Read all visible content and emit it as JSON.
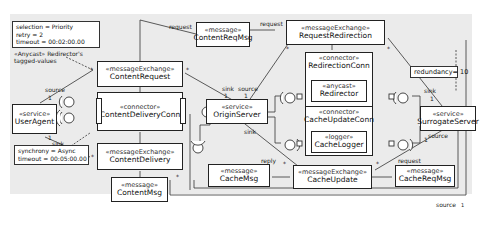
{
  "notes": {
    "redirector_values": [
      "selection = Priority",
      "retry = 2",
      "timeout = 00:02:00.00"
    ],
    "redirector_caption": [
      "«Anycast» Redirector's",
      "tagged-values"
    ],
    "delivery_values": [
      "synchrony = Async",
      "timeout = 00:05:00.00"
    ],
    "redundancy": "redundancy= 10"
  },
  "elements": {
    "user_agent": {
      "stereotype": "«service»",
      "name": "UserAgent"
    },
    "content_request": {
      "stereotype": "«messageExchange»",
      "name": "ContentRequest"
    },
    "content_delivery_conn": {
      "stereotype": "«connector»",
      "name": "ContentDeliveryConn"
    },
    "content_delivery": {
      "stereotype": "«messageExchange»",
      "name": "ContentDelivery"
    },
    "content_msg": {
      "stereotype": "«message»",
      "name": "ContentMsg"
    },
    "content_req_msg": {
      "stereotype": "«message»",
      "name": "ContentReqMsg"
    },
    "request_redirection": {
      "stereotype": "«messageExchange»",
      "name": "RequestRedirection"
    },
    "origin_server": {
      "stereotype": "«service»",
      "name": "OriginServer"
    },
    "redirection_conn": {
      "stereotype": "«connector»",
      "name": "RedirectionConn"
    },
    "redirector": {
      "stereotype": "«anycast»",
      "name": "Redirector"
    },
    "cache_update_conn": {
      "stereotype": "«connector»",
      "name": "CacheUpdateConn"
    },
    "cache_logger": {
      "stereotype": "«logger»",
      "name": "CacheLogger"
    },
    "surrogate_server": {
      "stereotype": "«service»",
      "name": "SurrogateServer"
    },
    "cache_msg": {
      "stereotype": "«message»",
      "name": "CacheMsg"
    },
    "cache_update": {
      "stereotype": "«messageExchange»",
      "name": "CacheUpdate"
    },
    "cache_req_msg": {
      "stereotype": "«message»",
      "name": "CacheReqMsg"
    }
  },
  "labels": {
    "request": "request",
    "reply": "reply",
    "source": "source",
    "sink": "sink",
    "one": "1",
    "many": "*"
  }
}
